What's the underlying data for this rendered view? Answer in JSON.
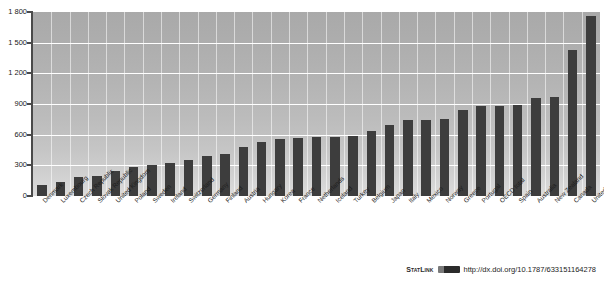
{
  "chart_data": {
    "type": "bar",
    "title": "",
    "xlabel": "",
    "ylabel": "",
    "ylim": [
      0,
      1800
    ],
    "grid": true,
    "legend": "none",
    "ytick_labels": [
      "1 800",
      "1 500",
      "1 200",
      "900",
      "600",
      "300",
      "0"
    ],
    "ytick_values": [
      1800,
      1500,
      1200,
      900,
      600,
      300,
      0
    ],
    "categories": [
      "Denmark",
      "Luxembourg",
      "Czech Republic",
      "Slovak Republic",
      "United Kingdom",
      "Poland",
      "Sweden",
      "Ireland",
      "Switzerland",
      "Germany",
      "Finland",
      "Austria",
      "Hungary",
      "Korea",
      "France",
      "Netherlands",
      "Iceland",
      "Turkey",
      "Belgium",
      "Japan",
      "Italy",
      "Mexico",
      "Norway",
      "Greece",
      "Portugal",
      "OECD total",
      "Spain",
      "Australia",
      "New Zealand",
      "Canada",
      "United States"
    ],
    "values": [
      110,
      140,
      185,
      195,
      245,
      280,
      300,
      320,
      350,
      395,
      410,
      480,
      530,
      555,
      565,
      575,
      580,
      590,
      640,
      690,
      740,
      745,
      750,
      845,
      880,
      880,
      890,
      960,
      970,
      1425,
      1765
    ],
    "series": [
      {
        "name": "value",
        "values": [
          110,
          140,
          185,
          195,
          245,
          280,
          300,
          320,
          350,
          395,
          410,
          480,
          530,
          555,
          565,
          575,
          580,
          590,
          640,
          690,
          740,
          745,
          750,
          845,
          880,
          880,
          890,
          960,
          970,
          1425,
          1765
        ]
      }
    ],
    "bar_color": "#3d3d3d",
    "plot_background": "#b4b4b4",
    "gridline_color": "#ffffff"
  },
  "footer": {
    "statlink_label": "StatLink",
    "badge_icon": "statlink-badge-icon",
    "url": "http://dx.doi.org/10.1787/633151164278"
  },
  "title_strip": {
    "text": ""
  }
}
